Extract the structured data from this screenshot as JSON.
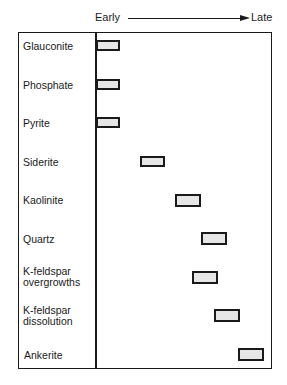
{
  "axis": {
    "start_label": "Early",
    "end_label": "Late",
    "direction": "arrow-right"
  },
  "rows": [
    {
      "label": "Glauconite",
      "bar_start": 0.0,
      "bar_end": 0.14
    },
    {
      "label": "Phosphate",
      "bar_start": 0.0,
      "bar_end": 0.14
    },
    {
      "label": "Pyrite",
      "bar_start": 0.0,
      "bar_end": 0.14
    },
    {
      "label": "Siderite",
      "bar_start": 0.25,
      "bar_end": 0.39
    },
    {
      "label": "Kaolinite",
      "bar_start": 0.45,
      "bar_end": 0.59
    },
    {
      "label": "Quartz",
      "bar_start": 0.59,
      "bar_end": 0.74
    },
    {
      "label": "K-feldspar\novergrowths",
      "bar_start": 0.55,
      "bar_end": 0.69
    },
    {
      "label": "K-feldspar\ndissolution",
      "bar_start": 0.67,
      "bar_end": 0.82
    },
    {
      "label": "Ankerite",
      "bar_start": 0.81,
      "bar_end": 0.95
    }
  ],
  "colors": {
    "bar_fill": "#e6e6e6",
    "line": "#1a1a1a"
  }
}
